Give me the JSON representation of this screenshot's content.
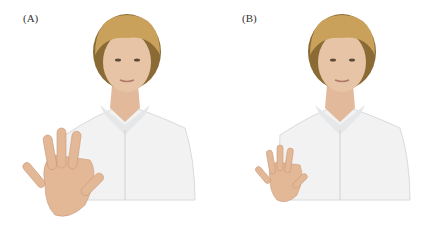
{
  "panels": [
    {
      "label": "(A)",
      "description": "Woman raising right hand with fingers spread wide (large hand)"
    },
    {
      "label": "(B)",
      "description": "Woman raising right hand with fingers spread (smaller hand)"
    }
  ],
  "colors": {
    "hair": "#c9a15a",
    "hair_dark": "#8a6a35",
    "skin": "#e8c4a6",
    "skin_shadow": "#d6a88a",
    "shirt": "#f2f2f2",
    "shirt_shadow": "#d9dadc"
  }
}
